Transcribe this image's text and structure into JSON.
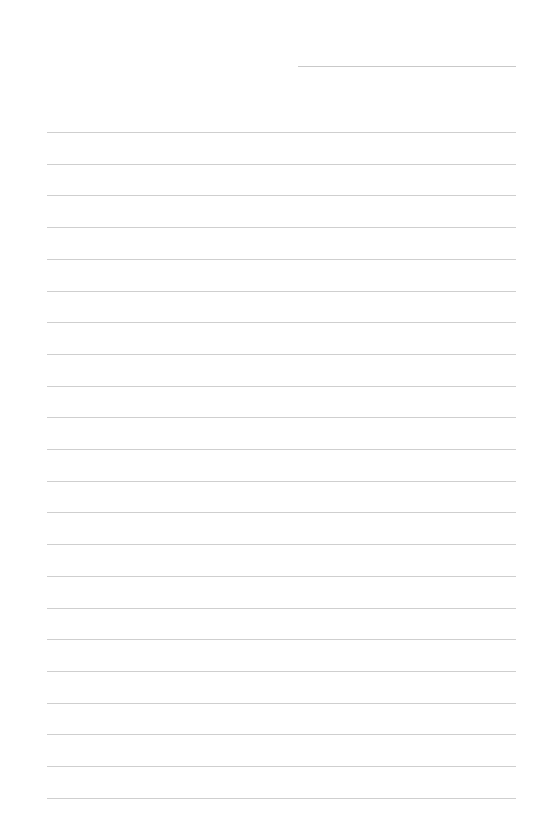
{
  "document": {
    "type": "lined-paper",
    "background_color": "#ffffff",
    "line_color": "#cfcfcf",
    "header_line": {
      "x": 298,
      "y": 66,
      "width": 218
    },
    "rules": {
      "count": 22,
      "x": 47,
      "width": 469,
      "start_y": 132,
      "spacing": 31.7
    }
  }
}
